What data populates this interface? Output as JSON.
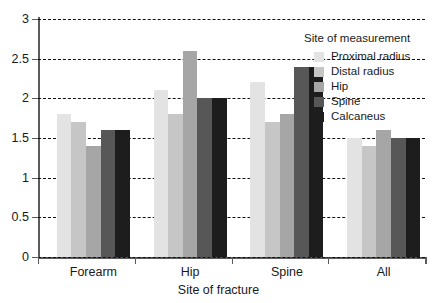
{
  "chart_data": {
    "type": "bar",
    "title": "",
    "xlabel": "Site of fracture",
    "ylabel": "",
    "ylim": [
      0,
      3
    ],
    "yticks": [
      "0",
      "0.5",
      "1",
      "1.5",
      "2",
      "2.5",
      "3"
    ],
    "ytick_values": [
      0,
      0.5,
      1,
      1.5,
      2,
      2.5,
      3
    ],
    "grid": "horizontal-dashed",
    "legend_position": "upper-right-inside",
    "legend_title": "Site of measurement",
    "categories": [
      "Forearm",
      "Hip",
      "Spine",
      "All"
    ],
    "series": [
      {
        "name": "Proximal radius",
        "color": "#e3e3e3",
        "values": [
          1.8,
          2.1,
          2.2,
          1.5
        ]
      },
      {
        "name": "Distal radius",
        "color": "#c6c6c6",
        "values": [
          1.7,
          1.8,
          1.7,
          1.4
        ]
      },
      {
        "name": "Hip",
        "color": "#a6a6a6",
        "values": [
          1.4,
          2.6,
          1.8,
          1.6
        ]
      },
      {
        "name": "Spine",
        "color": "#575757",
        "values": [
          1.6,
          2.0,
          2.4,
          1.5
        ]
      },
      {
        "name": "Calcaneus",
        "color": "#1d1d1d",
        "values": [
          1.6,
          2.0,
          2.4,
          1.5
        ]
      }
    ]
  },
  "axes": {
    "x_title": "Site of fracture",
    "axis_color": "#5b5b5b",
    "gridline_color": "#111111"
  }
}
